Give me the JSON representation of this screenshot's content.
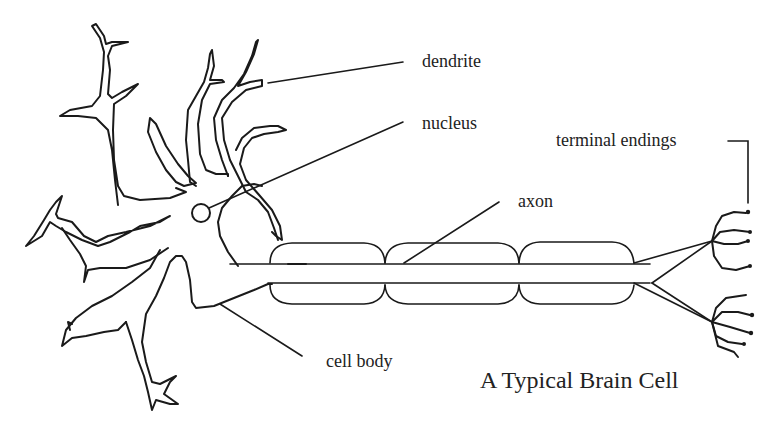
{
  "diagram": {
    "title": "A Typical Brain Cell",
    "labels": {
      "dendrite": "dendrite",
      "nucleus": "nucleus",
      "axon": "axon",
      "terminal_endings": "terminal endings",
      "cell_body": "cell body"
    },
    "colors": {
      "line": "#1a1a1a",
      "text": "#222222",
      "background": "#ffffff"
    }
  }
}
